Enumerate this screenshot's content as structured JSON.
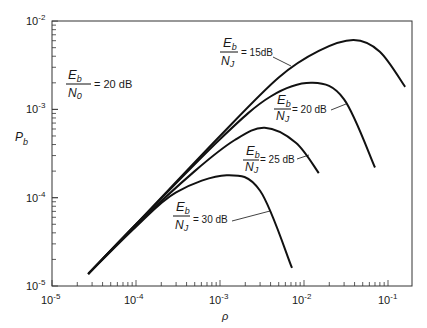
{
  "chart_data": {
    "type": "line",
    "title": "",
    "xlabel": "ρ",
    "ylabel": "P_b",
    "xscale": "log",
    "yscale": "log",
    "xlim": [
      1e-05,
      0.3
    ],
    "ylim": [
      1e-05,
      0.01
    ],
    "grid": false,
    "x_ticks": [
      "10^-5",
      "10^-4",
      "10^-3",
      "10^-2",
      "10^-1"
    ],
    "y_ticks": [
      "10^-5",
      "10^-4",
      "10^-3",
      "10^-2"
    ],
    "annotations": [
      {
        "text": "Eb/N0 = 20 dB",
        "num": "E",
        "num_sub": "b",
        "den": "N",
        "den_sub": "0",
        "value": "= 20 dB"
      }
    ],
    "series": [
      {
        "name": "Eb/NJ = 15 dB",
        "label_value": "= 15dB",
        "points": [
          [
            2.7e-05,
            1.37e-05
          ],
          [
            0.0001,
            5e-05
          ],
          [
            0.001,
            0.0005
          ],
          [
            0.005,
            0.0023
          ],
          [
            0.015,
            0.0046
          ],
          [
            0.039,
            0.0061
          ],
          [
            0.08,
            0.0045
          ],
          [
            0.16,
            0.0018
          ]
        ]
      },
      {
        "name": "Eb/NJ = 20 dB",
        "label_value": "= 20 dB",
        "points": [
          [
            2.7e-05,
            1.37e-05
          ],
          [
            0.0001,
            5e-05
          ],
          [
            0.001,
            0.00046
          ],
          [
            0.004,
            0.0014
          ],
          [
            0.0127,
            0.002
          ],
          [
            0.03,
            0.0013
          ],
          [
            0.07,
            0.00022
          ]
        ]
      },
      {
        "name": "Eb/NJ = 25 dB",
        "label_value": "= 25 dB",
        "points": [
          [
            2.7e-05,
            1.37e-05
          ],
          [
            0.0001,
            4.9e-05
          ],
          [
            0.0005,
            0.0002
          ],
          [
            0.0015,
            0.00045
          ],
          [
            0.0034,
            0.00062
          ],
          [
            0.008,
            0.00042
          ],
          [
            0.015,
            0.00019
          ]
        ]
      },
      {
        "name": "Eb/NJ = 30 dB",
        "label_value": "= 30 dB",
        "points": [
          [
            2.7e-05,
            1.37e-05
          ],
          [
            0.0001,
            4.7e-05
          ],
          [
            0.0003,
            0.000115
          ],
          [
            0.0012,
            0.00018
          ],
          [
            0.003,
            0.00012
          ],
          [
            0.0072,
            1.6e-05
          ]
        ]
      }
    ],
    "legend_position": "inline"
  },
  "labels": {
    "eb_num": "E",
    "eb_sub": "b",
    "n0_den": "N",
    "n0_sub": "0",
    "n0_value": "= 20 dB",
    "nj_den": "N",
    "nj_sub": "J",
    "v15": "= 15dB",
    "v20": "= 20 dB",
    "v25": "= 25 dB",
    "v30": "= 30 dB",
    "xlabel": "ρ",
    "ylabel_main": "P",
    "ylabel_sub": "b",
    "tick_base": "10",
    "xt": [
      "-5",
      "-4",
      "-3",
      "-2",
      "-1"
    ],
    "yt": [
      "-2",
      "-3",
      "-4",
      "-5"
    ]
  }
}
